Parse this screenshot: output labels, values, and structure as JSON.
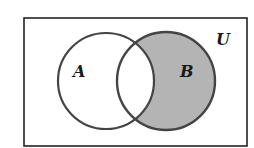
{
  "diagram": {
    "type": "venn",
    "universe_label": "U",
    "sets": [
      {
        "id": "A",
        "label": "A",
        "cx": 106,
        "cy": 81,
        "r": 48
      },
      {
        "id": "B",
        "label": "B",
        "cx": 166,
        "cy": 81,
        "r": 49
      }
    ],
    "shaded_region": "B \\ A",
    "colors": {
      "stroke": "#444444",
      "frame": "#222222",
      "shade": "#b4b4b4",
      "background": "#ffffff"
    }
  }
}
